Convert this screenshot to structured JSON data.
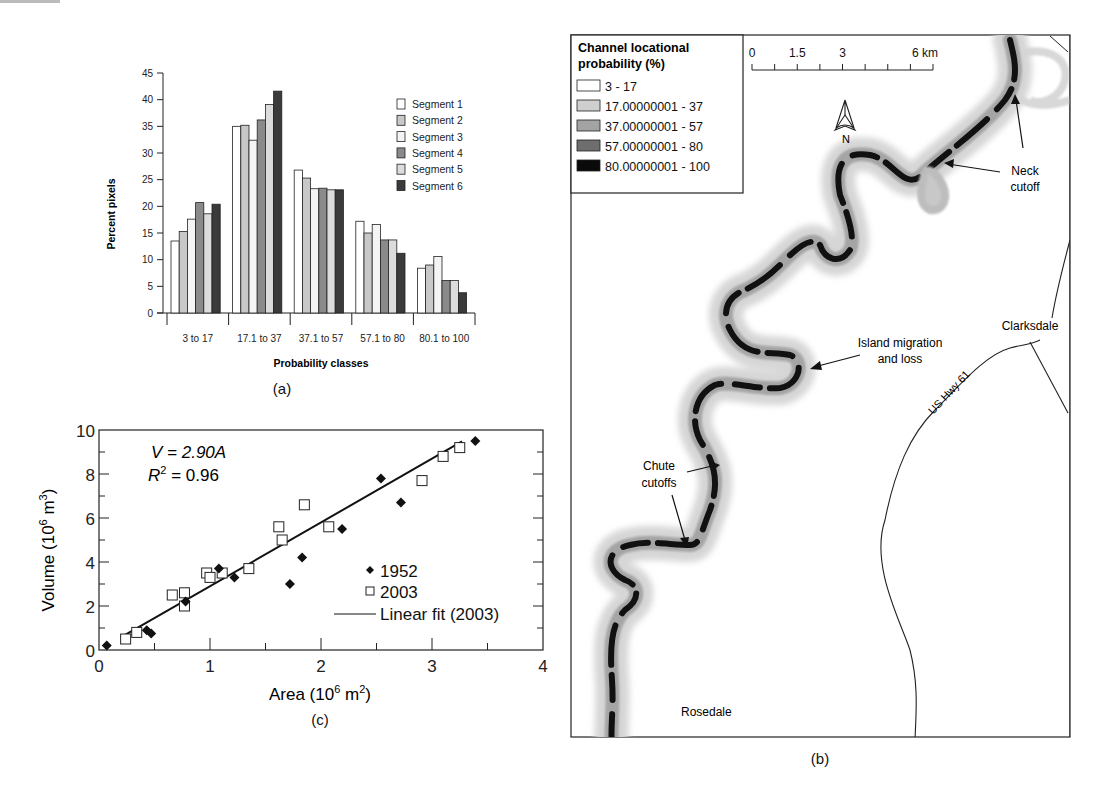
{
  "chart_data": [
    {
      "panel": "a",
      "type": "bar",
      "title": "",
      "xlabel": "Probability classes",
      "ylabel": "Percent pixels",
      "ylim": [
        0,
        45
      ],
      "yticks": [
        0,
        5,
        10,
        15,
        20,
        25,
        30,
        35,
        40,
        45
      ],
      "categories": [
        "3 to 17",
        "17.1 to 37",
        "37.1 to 57",
        "57.1 to 80",
        "80.1 to 100"
      ],
      "legend_position": "upper right",
      "grid": false,
      "series": [
        {
          "name": "Segment 1",
          "color": "#ffffff",
          "values": [
            13.5,
            35.0,
            26.8,
            17.2,
            8.4
          ]
        },
        {
          "name": "Segment 2",
          "color": "#c8c8c8",
          "values": [
            15.3,
            35.2,
            25.3,
            15.0,
            9.0
          ]
        },
        {
          "name": "Segment 3",
          "color": "#f4f4f4",
          "values": [
            17.6,
            32.4,
            23.3,
            16.6,
            10.6
          ]
        },
        {
          "name": "Segment 4",
          "color": "#8a8a8a",
          "values": [
            20.7,
            36.2,
            23.4,
            13.7,
            6.1
          ]
        },
        {
          "name": "Segment 5",
          "color": "#dcdcdc",
          "values": [
            18.6,
            39.1,
            23.1,
            13.7,
            6.1
          ]
        },
        {
          "name": "Segment 6",
          "color": "#3a3a3a",
          "values": [
            20.4,
            41.6,
            23.1,
            11.2,
            3.8
          ]
        }
      ],
      "caption": "(a)"
    },
    {
      "panel": "c",
      "type": "scatter",
      "title": "",
      "xlabel": "Area (10⁶ m²)",
      "ylabel": "Volume (10⁶ m³)",
      "xlim": [
        0,
        4
      ],
      "ylim": [
        0,
        10
      ],
      "xticks": [
        0,
        1,
        2,
        3,
        4
      ],
      "yticks": [
        0,
        2,
        4,
        6,
        8,
        10
      ],
      "annotations": [
        "V = 2.90A",
        "R² = 0.96"
      ],
      "legend_position": "lower right",
      "series": [
        {
          "name": "1952",
          "marker": "filled-diamond",
          "x": [
            0.07,
            0.43,
            0.47,
            0.78,
            1.08,
            1.22,
            1.72,
            1.83,
            2.19,
            2.54,
            2.72,
            3.39
          ],
          "y": [
            0.2,
            0.9,
            0.75,
            2.2,
            3.7,
            3.3,
            3.0,
            4.2,
            5.5,
            7.8,
            6.7,
            9.5
          ]
        },
        {
          "name": "2003",
          "marker": "open-square",
          "x": [
            0.24,
            0.34,
            0.66,
            0.77,
            0.77,
            0.97,
            1.0,
            1.11,
            1.35,
            1.62,
            1.65,
            1.85,
            2.07,
            2.91,
            3.1,
            3.25
          ],
          "y": [
            0.5,
            0.8,
            2.5,
            2.6,
            2.0,
            3.5,
            3.3,
            3.5,
            3.7,
            5.6,
            5.0,
            6.6,
            5.6,
            7.7,
            8.8,
            9.2
          ]
        },
        {
          "name": "Linear fit (2003)",
          "type": "line",
          "x": [
            0.2,
            3.27
          ],
          "y": [
            0.58,
            9.48
          ]
        }
      ],
      "caption": "(c)"
    }
  ],
  "map": {
    "caption": "(b)",
    "legend": {
      "title_line1": "Channel locational",
      "title_line2": "probability (%)",
      "items": [
        {
          "label": "3 - 17",
          "color": "#ffffff"
        },
        {
          "label": "17.00000001 - 37",
          "color": "#cfcfcf"
        },
        {
          "label": "37.00000001 - 57",
          "color": "#a3a3a3"
        },
        {
          "label": "57.00000001 - 80",
          "color": "#6e6e6e"
        },
        {
          "label": "80.00000001 - 100",
          "color": "#0a0a0a"
        }
      ]
    },
    "scale": {
      "labels": [
        "0",
        "1.5",
        "3",
        "6 km"
      ]
    },
    "north_label": "N",
    "annotations": {
      "neck_line1": "Neck",
      "neck_line2": "cutoff",
      "island_line1": "Island migration",
      "island_line2": "and loss",
      "chute_line1": "Chute",
      "chute_line2": "cutoffs",
      "clarksdale": "Clarksdale",
      "highway": "US Hwy 61",
      "rosedale": "Rosedale"
    }
  },
  "ui": {
    "panel_a_ylabel": "Percent pixels",
    "panel_a_xlabel": "Probability classes",
    "panel_a_yticks": [
      "0",
      "5",
      "10",
      "15",
      "20",
      "25",
      "30",
      "35",
      "40",
      "45"
    ],
    "panel_a_categories": [
      "3 to 17",
      "17.1 to 37",
      "37.1 to 57",
      "57.1 to 80",
      "80.1 to 100"
    ],
    "panel_a_legend": [
      "Segment 1",
      "Segment 2",
      "Segment 3",
      "Segment 4",
      "Segment 5",
      "Segment 6"
    ],
    "panel_c_yticks": [
      "0",
      "2",
      "4",
      "6",
      "8",
      "10"
    ],
    "panel_c_xticks": [
      "0",
      "1",
      "2",
      "3",
      "4"
    ],
    "panel_c_eq": "V = 2.90A",
    "panel_c_r2_lhs": "R",
    "panel_c_r2_sup": "2",
    "panel_c_r2_rhs": " = 0.96",
    "panel_c_legend": [
      "1952",
      "2003",
      "Linear fit (2003)"
    ],
    "panel_c_ylabel_a": "Volume (10",
    "panel_c_ylabel_sup1": "6",
    "panel_c_ylabel_b": " m",
    "panel_c_ylabel_sup2": "3",
    "panel_c_ylabel_c": ")",
    "panel_c_xlabel_a": "Area (10",
    "panel_c_xlabel_sup1": "6",
    "panel_c_xlabel_b": " m",
    "panel_c_xlabel_sup2": "2",
    "panel_c_xlabel_c": ")",
    "caption_a": "(a)",
    "caption_b": "(b)",
    "caption_c": "(c)"
  }
}
